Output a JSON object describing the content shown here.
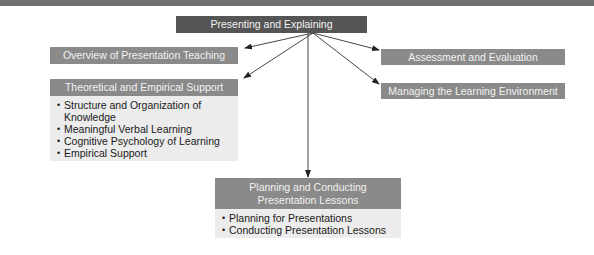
{
  "diagram": {
    "root": {
      "label": "Presenting and Explaining"
    },
    "nodes": [
      {
        "id": "overview",
        "label": "Overview of Presentation Teaching"
      },
      {
        "id": "theoretical",
        "label": "Theoretical and Empirical Support",
        "items": [
          "Structure and Organization of Knowledge",
          "Meaningful Verbal Learning",
          "Cognitive Psychology of Learning",
          "Empirical Support"
        ]
      },
      {
        "id": "assessment",
        "label": "Assessment and Evaluation"
      },
      {
        "id": "managing",
        "label": "Managing the Learning Environment"
      },
      {
        "id": "planning",
        "label": "Planning and Conducting Presentation Lessons",
        "items": [
          "Planning for Presentations",
          "Conducting Presentation Lessons"
        ]
      }
    ],
    "edges": [
      {
        "from": "root",
        "to": "overview"
      },
      {
        "from": "root",
        "to": "theoretical"
      },
      {
        "from": "root",
        "to": "assessment"
      },
      {
        "from": "root",
        "to": "managing"
      },
      {
        "from": "root",
        "to": "planning"
      }
    ],
    "colors": {
      "top_bar": "#707070",
      "root_fill": "#555555",
      "node_fill": "#8a8a8a",
      "list_fill": "#ececec",
      "arrow": "#222222"
    }
  }
}
